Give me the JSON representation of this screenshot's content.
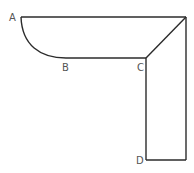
{
  "diagram": {
    "type": "geometric-figure",
    "stroke_color": "#2b2b2b",
    "label_color": "#555555",
    "points": {
      "A": {
        "label": "A",
        "x": 21,
        "y": 17
      },
      "B": {
        "label": "B",
        "x": 66,
        "y": 58
      },
      "C": {
        "label": "C",
        "x": 146,
        "y": 58
      },
      "D": {
        "label": "D",
        "x": 146,
        "y": 160
      }
    },
    "unlabeled_points": {
      "top_right": {
        "x": 186,
        "y": 17
      },
      "bottom_right": {
        "x": 186,
        "y": 160
      }
    },
    "edges": [
      {
        "from": "A",
        "to": "top_right",
        "kind": "line"
      },
      {
        "from": "A",
        "to": "B",
        "kind": "curve"
      },
      {
        "from": "B",
        "to": "C",
        "kind": "line"
      },
      {
        "from": "C",
        "to": "top_right",
        "kind": "line"
      },
      {
        "from": "C",
        "to": "D",
        "kind": "line"
      },
      {
        "from": "D",
        "to": "bottom_right",
        "kind": "line"
      },
      {
        "from": "top_right",
        "to": "bottom_right",
        "kind": "line"
      }
    ]
  }
}
